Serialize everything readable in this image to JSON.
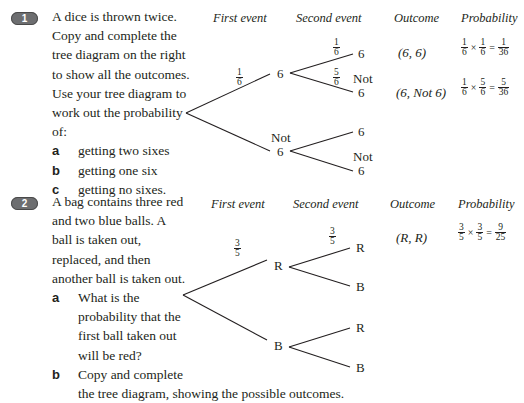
{
  "questions": [
    {
      "number": "1",
      "lines": [
        "A dice is thrown twice.",
        "Copy and complete the",
        "tree diagram on the right",
        "to show all the outcomes.",
        "Use your tree diagram to",
        "work out the probability",
        "of:"
      ],
      "parts": [
        {
          "letter": "a",
          "text": "getting two sixes"
        },
        {
          "letter": "b",
          "text": "getting one six"
        },
        {
          "letter": "c",
          "text": "getting no sixes."
        }
      ],
      "headers": {
        "first": "First event",
        "second": "Second event",
        "outcome": "Outcome",
        "probability": "Probability"
      },
      "tree": {
        "first_branch_prob": {
          "num": "1",
          "den": "6"
        },
        "first_upper": "6",
        "first_lower_top": "Not",
        "first_lower_bottom": "6",
        "upper_upper_prob": {
          "num": "1",
          "den": "6"
        },
        "upper_lower_prob": {
          "num": "5",
          "den": "6"
        },
        "leaf_uu": "6",
        "leaf_ul_top": "Not",
        "leaf_ul_bottom": "6",
        "leaf_lu": "6",
        "leaf_ll_top": "Not",
        "leaf_ll_bottom": "6"
      },
      "outcomes": [
        {
          "label": "(6, 6)",
          "p1": {
            "num": "1",
            "den": "6"
          },
          "p2": {
            "num": "1",
            "den": "6"
          },
          "res": {
            "num": "1",
            "den": "36"
          }
        },
        {
          "label": "(6, Not 6)",
          "p1": {
            "num": "1",
            "den": "6"
          },
          "p2": {
            "num": "5",
            "den": "6"
          },
          "res": {
            "num": "5",
            "den": "36"
          }
        }
      ]
    },
    {
      "number": "2",
      "lines": [
        "A bag contains three red",
        "and two blue balls. A",
        "ball is taken out,",
        "replaced, and then",
        "another ball is taken out."
      ],
      "parts": [
        {
          "letter": "a",
          "lines": [
            "What is the",
            "probability that the",
            "first ball taken out",
            "will be red?"
          ]
        },
        {
          "letter": "b",
          "lines": [
            "Copy and complete",
            "the tree diagram, showing the possible outcomes."
          ]
        }
      ],
      "headers": {
        "first": "First event",
        "second": "Second event",
        "outcome": "Outcome",
        "probability": "Probability"
      },
      "tree": {
        "first_branch_prob": {
          "num": "3",
          "den": "5"
        },
        "first_upper": "R",
        "first_lower": "B",
        "upper_upper_prob": {
          "num": "3",
          "den": "5"
        },
        "leaf_uu": "R",
        "leaf_ul": "B",
        "leaf_lu": "R",
        "leaf_ll": "B"
      },
      "outcomes": [
        {
          "label": "(R, R)",
          "p1": {
            "num": "3",
            "den": "5"
          },
          "p2": {
            "num": "3",
            "den": "5"
          },
          "res": {
            "num": "9",
            "den": "25"
          }
        }
      ]
    }
  ],
  "symbols": {
    "times": "×",
    "equals": "="
  }
}
